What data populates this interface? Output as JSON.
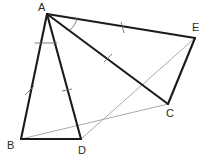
{
  "figure": {
    "canvas": {
      "width": 212,
      "height": 164
    },
    "background_color": "#ffffff",
    "stroke_color_main": "#1b1b1b",
    "stroke_color_auxiliary": "#9a9a9a",
    "stroke_color_marks": "#6f6f6f",
    "label_color": "#2a2a2a"
  },
  "points": {
    "A": {
      "label": "A",
      "x": 47,
      "y": 14,
      "label_x": 38,
      "label_y": 2
    },
    "B": {
      "label": "B",
      "x": 21,
      "y": 139,
      "label_x": 7,
      "label_y": 140
    },
    "C": {
      "label": "C",
      "x": 168,
      "y": 104,
      "label_x": 166,
      "label_y": 108
    },
    "D": {
      "label": "D",
      "x": 81,
      "y": 139,
      "label_x": 78,
      "label_y": 145
    },
    "E": {
      "label": "E",
      "x": 195,
      "y": 38,
      "label_x": 192,
      "label_y": 22
    }
  },
  "segments": {
    "main": [
      {
        "name": "segment-AB",
        "from": "A",
        "to": "B",
        "d": "M 47 14 L 21 139"
      },
      {
        "name": "segment-AD",
        "from": "A",
        "to": "D",
        "d": "M 47 14 L 81 139"
      },
      {
        "name": "segment-BD",
        "from": "B",
        "to": "D",
        "d": "M 21 139 L 81 139"
      },
      {
        "name": "segment-AE",
        "from": "A",
        "to": "E",
        "d": "M 47 14 L 195 38"
      },
      {
        "name": "segment-AC",
        "from": "A",
        "to": "C",
        "d": "M 47 14 L 168 104"
      },
      {
        "name": "segment-EC",
        "from": "E",
        "to": "C",
        "d": "M 195 38 L 168 104"
      }
    ],
    "auxiliary": [
      {
        "name": "segment-BC",
        "from": "B",
        "to": "C",
        "d": "M 21 139 L 168 104"
      },
      {
        "name": "segment-DE",
        "from": "D",
        "to": "E",
        "d": "M 81 139 L 195 38"
      }
    ]
  },
  "tick_marks": [
    {
      "name": "tick-on-AB",
      "on": "AB",
      "d": "M 25 95 L 34 86"
    },
    {
      "name": "tick-on-AD",
      "on": "AD",
      "d": "M 62 91 L 72 89"
    },
    {
      "name": "tick-on-AE",
      "on": "AE",
      "d": "M 121 22 L 124 33"
    },
    {
      "name": "tick-on-AC",
      "on": "AC",
      "d": "M 104 62 L 112 54"
    }
  ],
  "angle_arcs": [
    {
      "name": "angle-arc-BAD",
      "at": "A",
      "d": "M 35 43 L 57 43"
    },
    {
      "name": "angle-arc-EAC",
      "at": "A",
      "d": "M 77 18 Q 76 25 70 30"
    }
  ]
}
